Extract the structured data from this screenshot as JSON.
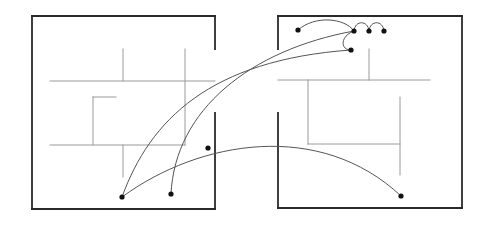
{
  "diagram": {
    "title": "",
    "colors": {
      "wall": "#2a2a2a",
      "inner_line": "#9a9a9a",
      "path": "#555555",
      "node": "#111111",
      "background": "#ffffff"
    },
    "rooms": [
      {
        "id": "left-room",
        "walls": [
          {
            "x1": 32,
            "y1": 16,
            "x2": 215,
            "y2": 16
          },
          {
            "x1": 32,
            "y1": 16,
            "x2": 32,
            "y2": 209
          },
          {
            "x1": 32,
            "y1": 209,
            "x2": 215,
            "y2": 209
          },
          {
            "x1": 215,
            "y1": 16,
            "x2": 215,
            "y2": 49
          },
          {
            "x1": 215,
            "y1": 113,
            "x2": 215,
            "y2": 209
          }
        ],
        "inner_lines": [
          {
            "x1": 50,
            "y1": 81,
            "x2": 215,
            "y2": 81
          },
          {
            "x1": 50,
            "y1": 145,
            "x2": 185,
            "y2": 145
          },
          {
            "x1": 123,
            "y1": 49,
            "x2": 123,
            "y2": 81
          },
          {
            "x1": 185,
            "y1": 49,
            "x2": 185,
            "y2": 145
          },
          {
            "x1": 123,
            "y1": 145,
            "x2": 123,
            "y2": 177
          },
          {
            "x1": 93,
            "y1": 97,
            "x2": 93,
            "y2": 145
          },
          {
            "x1": 93,
            "y1": 97,
            "x2": 116,
            "y2": 97
          }
        ]
      },
      {
        "id": "right-room",
        "walls": [
          {
            "x1": 278,
            "y1": 16,
            "x2": 462,
            "y2": 16
          },
          {
            "x1": 462,
            "y1": 16,
            "x2": 462,
            "y2": 208
          },
          {
            "x1": 278,
            "y1": 208,
            "x2": 462,
            "y2": 208
          },
          {
            "x1": 278,
            "y1": 16,
            "x2": 278,
            "y2": 49
          },
          {
            "x1": 278,
            "y1": 113,
            "x2": 278,
            "y2": 208
          }
        ],
        "inner_lines": [
          {
            "x1": 278,
            "y1": 80,
            "x2": 430,
            "y2": 80
          },
          {
            "x1": 369,
            "y1": 49,
            "x2": 369,
            "y2": 80
          },
          {
            "x1": 308,
            "y1": 80,
            "x2": 308,
            "y2": 144
          },
          {
            "x1": 308,
            "y1": 144,
            "x2": 400,
            "y2": 144
          },
          {
            "x1": 400,
            "y1": 97,
            "x2": 400,
            "y2": 175
          }
        ]
      }
    ],
    "nodes": [
      {
        "id": "n1",
        "x": 122,
        "y": 197
      },
      {
        "id": "n2",
        "x": 171,
        "y": 194
      },
      {
        "id": "n3",
        "x": 208,
        "y": 148
      },
      {
        "id": "n4",
        "x": 401,
        "y": 196
      },
      {
        "id": "n5",
        "x": 298,
        "y": 30
      },
      {
        "id": "n6",
        "x": 354,
        "y": 31
      },
      {
        "id": "n7",
        "x": 369,
        "y": 31
      },
      {
        "id": "n8",
        "x": 384,
        "y": 31
      },
      {
        "id": "n9",
        "x": 351,
        "y": 50
      }
    ],
    "paths": [
      {
        "id": "p1",
        "d": "M122,197 C150,120 210,60 351,50"
      },
      {
        "id": "p2",
        "d": "M171,194 C175,110 250,50 354,31"
      },
      {
        "id": "p3",
        "d": "M122,197 C200,140 320,120 401,196"
      },
      {
        "id": "p4",
        "d": "M298,30 C315,15 345,18 354,31"
      },
      {
        "id": "p5",
        "d": "M354,31 C340,36 340,50 351,50"
      },
      {
        "id": "p6",
        "d": "M354,31 C355,20 368,20 369,31"
      },
      {
        "id": "p7",
        "d": "M369,31 C370,20 383,20 384,31"
      }
    ]
  }
}
